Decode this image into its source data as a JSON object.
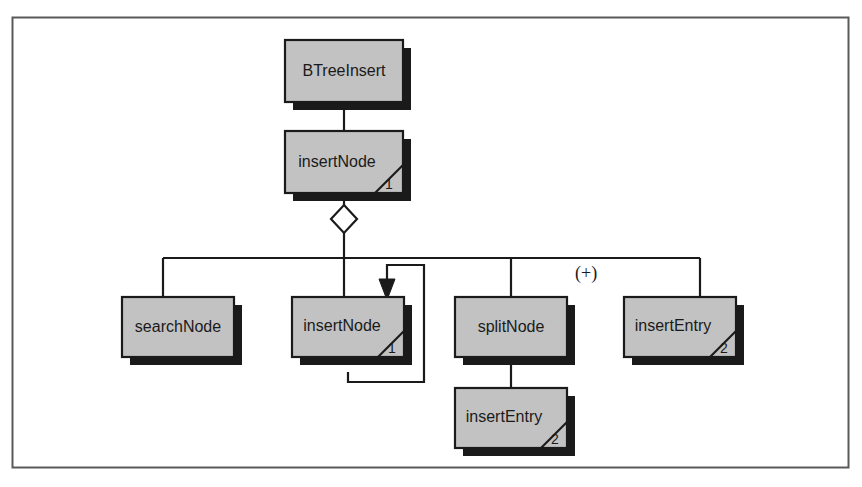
{
  "diagram": {
    "type": "call-hierarchy-diagram",
    "frame": {
      "border_color": "#5a5a5a"
    },
    "style": {
      "node_fill": "#c2c2c2",
      "node_stroke": "#1a1a1a",
      "node_shadow": "#1a1a1a",
      "line_color": "#1a1a1a",
      "background": "#ffffff"
    },
    "nodes": [
      {
        "id": "btreeinsert",
        "label": "BTreeInsert",
        "x": 285,
        "y": 40,
        "w": 118,
        "h": 62,
        "corner_cut": false,
        "corner_number": ""
      },
      {
        "id": "insertnode-top",
        "label": "insertNode",
        "x": 285,
        "y": 131,
        "w": 118,
        "h": 62,
        "corner_cut": true,
        "corner_number": "1"
      },
      {
        "id": "searchnode",
        "label": "searchNode",
        "x": 122,
        "y": 297,
        "w": 112,
        "h": 60,
        "corner_cut": false,
        "corner_number": ""
      },
      {
        "id": "insertnode-recursive",
        "label": "insertNode",
        "x": 292,
        "y": 297,
        "w": 112,
        "h": 60,
        "corner_cut": true,
        "corner_number": "1"
      },
      {
        "id": "splitnode",
        "label": "splitNode",
        "x": 455,
        "y": 297,
        "w": 112,
        "h": 60,
        "corner_cut": false,
        "corner_number": ""
      },
      {
        "id": "insertentry-right",
        "label": "insertEntry",
        "x": 624,
        "y": 297,
        "w": 112,
        "h": 60,
        "corner_cut": true,
        "corner_number": "2"
      },
      {
        "id": "insertentry-bottom",
        "label": "insertEntry",
        "x": 455,
        "y": 388,
        "w": 112,
        "h": 60,
        "corner_cut": true,
        "corner_number": "2"
      }
    ],
    "connector_diamond": {
      "id": "aggregation-diamond",
      "cx": 344,
      "cy": 219,
      "rx": 13,
      "ry": 14,
      "fill": "#ffffff"
    },
    "annotations": [
      {
        "id": "plus-marker",
        "text": "(+)",
        "x": 575,
        "y": 279
      }
    ],
    "edges": [
      {
        "id": "edge-btreeinsert-insertnode",
        "from": "btreeinsert",
        "to": "insertnode-top"
      },
      {
        "id": "edge-insertnode-diamond",
        "from": "insertnode-top",
        "to": "aggregation-diamond"
      },
      {
        "id": "edge-diamond-bus",
        "from": "aggregation-diamond",
        "to": "bus"
      },
      {
        "id": "edge-bus-searchnode",
        "from": "bus",
        "to": "searchnode"
      },
      {
        "id": "edge-bus-insertnode-recursive",
        "from": "bus",
        "to": "insertnode-recursive"
      },
      {
        "id": "edge-bus-splitnode",
        "from": "bus",
        "to": "splitnode"
      },
      {
        "id": "edge-bus-insertentry-right",
        "from": "bus",
        "to": "insertentry-right"
      },
      {
        "id": "edge-splitnode-insertentry",
        "from": "splitnode",
        "to": "insertentry-bottom"
      },
      {
        "id": "edge-recursion-loop",
        "from": "insertnode-recursive",
        "to": "insertnode-recursive",
        "kind": "self-recursion-arrow"
      }
    ]
  }
}
